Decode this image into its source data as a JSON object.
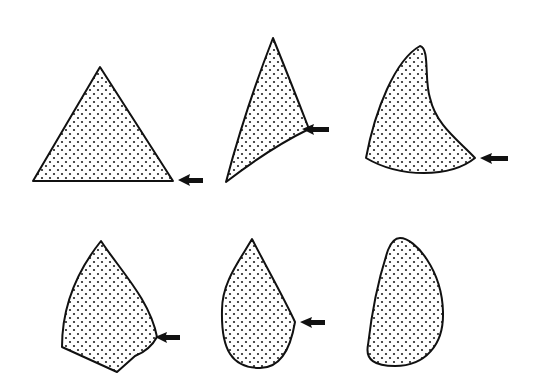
{
  "diagram": {
    "background_color": "#ffffff",
    "ink_color": "#111111",
    "fill_pattern": "stipple-dots",
    "shapes": [
      {
        "id": "shape-1",
        "description": "equilateral triangle",
        "row": 1,
        "column": 1,
        "has_arrow": true,
        "arrow_direction": "left",
        "arrow_points_to": "bottom-right corner"
      },
      {
        "id": "shape-2",
        "description": "elongated triangle with curved bottom edge",
        "row": 1,
        "column": 2,
        "has_arrow": true,
        "arrow_direction": "left",
        "arrow_points_to": "right corner"
      },
      {
        "id": "shape-3",
        "description": "curved horn/fin shape",
        "row": 1,
        "column": 3,
        "has_arrow": true,
        "arrow_direction": "left",
        "arrow_points_to": "bottom-right corner"
      },
      {
        "id": "shape-4",
        "description": "pointed kite / arrowhead shape",
        "row": 2,
        "column": 1,
        "has_arrow": true,
        "arrow_direction": "left",
        "arrow_points_to": "right corner"
      },
      {
        "id": "shape-5",
        "description": "teardrop shape with right corner",
        "row": 2,
        "column": 2,
        "has_arrow": true,
        "arrow_direction": "left",
        "arrow_points_to": "right corner"
      },
      {
        "id": "shape-6",
        "description": "rounded oval / bean shape",
        "row": 2,
        "column": 3,
        "has_arrow": false
      }
    ]
  }
}
